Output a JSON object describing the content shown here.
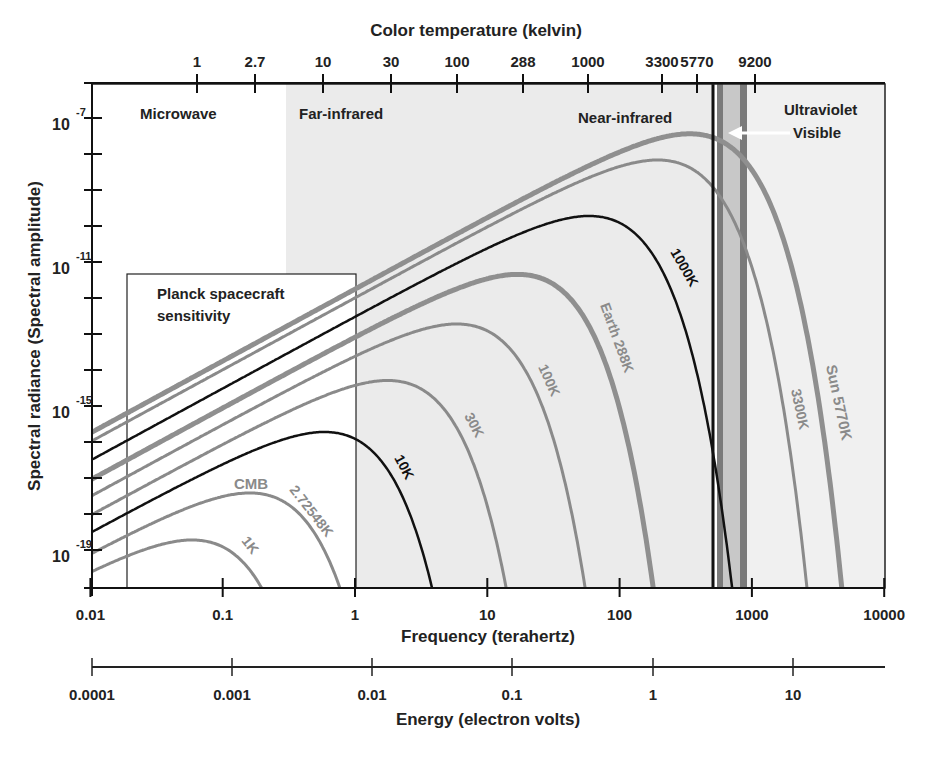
{
  "chart_data": {
    "type": "line",
    "title": "",
    "xlabel": "Frequency (terahertz)",
    "ylabel": "Spectral radiance (Spectral amplitude)",
    "x_scale": "log",
    "y_scale": "log",
    "xlim": [
      0.01,
      10000
    ],
    "ylim": [
      1e-20,
      1e-06
    ],
    "x_ticks": [
      "0.01",
      "0.1",
      "1",
      "10",
      "100",
      "1000",
      "10000"
    ],
    "x_tick_values": [
      0.01,
      0.1,
      1,
      10,
      100,
      1000,
      10000
    ],
    "y_tick_labels": [
      {
        "base": "10",
        "exp": "-7",
        "value": -7
      },
      {
        "base": "10",
        "exp": "-11",
        "value": -11
      },
      {
        "base": "10",
        "exp": "-15",
        "value": -15
      },
      {
        "base": "10",
        "exp": "-19",
        "value": -19
      }
    ],
    "y_minor_ticks": [
      -7,
      -8,
      -9,
      -10,
      -11,
      -12,
      -13,
      -14,
      -15,
      -16,
      -17,
      -18,
      -19
    ],
    "top_axis": {
      "label": "Color temperature (kelvin)",
      "ticks": [
        "1",
        "2.7",
        "10",
        "30",
        "100",
        "288",
        "1000",
        "3300",
        "5770",
        "9200"
      ],
      "tick_x_px": [
        197,
        255,
        323,
        391,
        457,
        523,
        588,
        662,
        697,
        755
      ]
    },
    "energy_axis": {
      "label": "Energy (electron volts)",
      "ticks": [
        "0.0001",
        "0.001",
        "0.01",
        "0.1",
        "1",
        "10"
      ],
      "tick_x_px": [
        92,
        232,
        372,
        512,
        653,
        793
      ]
    },
    "regions": [
      {
        "name": "Microwave",
        "from_thz": 0.01,
        "to_thz": 0.3,
        "fill": "#ffffff"
      },
      {
        "name": "Far-infrared",
        "from_thz": 0.3,
        "to_thz": 430,
        "fill": "#ebebeb"
      },
      {
        "name": "Near-infrared",
        "from_thz": 0.3,
        "to_thz": 430,
        "fill": "#ebebeb"
      },
      {
        "name": "Visible",
        "from_thz": 430,
        "to_thz": 750,
        "fill": "#b5b5b5"
      },
      {
        "name": "Ultraviolet",
        "from_thz": 750,
        "to_thz": 10000,
        "fill": "#f0f0f0"
      }
    ],
    "region_labels": {
      "microwave": "Microwave",
      "far_infrared": "Far-infrared",
      "near_infrared": "Near-infrared",
      "ultraviolet": "Ultraviolet",
      "visible": "Visible"
    },
    "planck_box": {
      "label_line1": "Planck spacecraft",
      "label_line2": "sensitivity",
      "from_thz": 0.018,
      "to_thz": 1.0,
      "top_log_radiance": -11.43
    },
    "series": [
      {
        "name": "1K",
        "temperature_k": 1,
        "color": "#8a8a8a",
        "width": 3,
        "label": "1K"
      },
      {
        "name": "CMB 2.72548K",
        "temperature_k": 2.72548,
        "color": "#8a8a8a",
        "width": 3,
        "label": "2.72548K",
        "extra_label": "CMB"
      },
      {
        "name": "10K",
        "temperature_k": 10,
        "color": "#111111",
        "width": 2.5,
        "label": "10K"
      },
      {
        "name": "30K",
        "temperature_k": 30,
        "color": "#8a8a8a",
        "width": 3,
        "label": "30K"
      },
      {
        "name": "100K",
        "temperature_k": 100,
        "color": "#8a8a8a",
        "width": 3,
        "label": "100K"
      },
      {
        "name": "Earth 288K",
        "temperature_k": 288,
        "color": "#8f8f8f",
        "width": 5,
        "label": "Earth 288K"
      },
      {
        "name": "1000K",
        "temperature_k": 1000,
        "color": "#111111",
        "width": 2.5,
        "label": "1000K"
      },
      {
        "name": "3300K",
        "temperature_k": 3300,
        "color": "#8a8a8a",
        "width": 3,
        "label": "3300K"
      },
      {
        "name": "Sun 5770K",
        "temperature_k": 5770,
        "color": "#8f8f8f",
        "width": 5,
        "label": "Sun 5770K"
      }
    ],
    "peaks_approx": [
      {
        "series": "1K",
        "freq_thz": 0.059,
        "log_radiance": -18.7
      },
      {
        "series": "CMB 2.72548K",
        "freq_thz": 0.16,
        "log_radiance": -17.4
      },
      {
        "series": "10K",
        "freq_thz": 0.59,
        "log_radiance": -15.7
      },
      {
        "series": "30K",
        "freq_thz": 1.76,
        "log_radiance": -14.3
      },
      {
        "series": "100K",
        "freq_thz": 5.9,
        "log_radiance": -12.7
      },
      {
        "series": "Earth 288K",
        "freq_thz": 16.9,
        "log_radiance": -11.3
      },
      {
        "series": "1000K",
        "freq_thz": 58.8,
        "log_radiance": -9.7
      },
      {
        "series": "3300K",
        "freq_thz": 194,
        "log_radiance": -8.1
      },
      {
        "series": "Sun 5770K",
        "freq_thz": 339,
        "log_radiance": -7.4
      }
    ],
    "annotation_arrow": {
      "text": "Visible",
      "points_to_thz": 600
    }
  }
}
